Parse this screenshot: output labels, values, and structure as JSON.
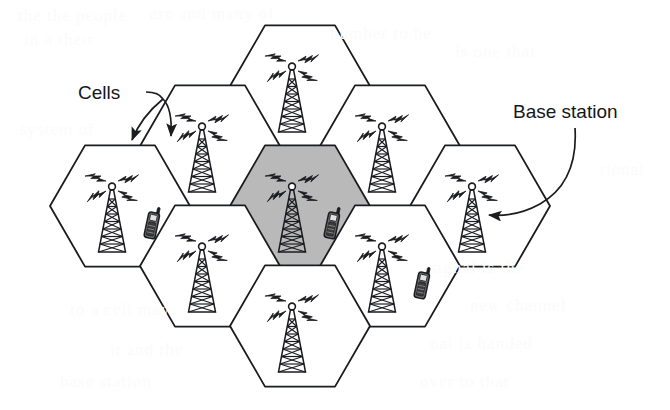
{
  "figure": {
    "background_color": "#ffffff",
    "stroke_color": "#1b1c20",
    "shaded_cell_color": "#b9b9b9",
    "labels": {
      "cells": "Cells",
      "base_station": "Base station"
    },
    "annotations": [
      {
        "id": "cells-label",
        "text": "Cells",
        "x": 110,
        "y": 93,
        "arrows": 2
      },
      {
        "id": "base-station-label",
        "text": "Base station",
        "x": 588,
        "y": 112,
        "arrows": 1
      }
    ],
    "cells": [
      {
        "id": "cell-top",
        "cx": 300,
        "cy": 86,
        "shaded": false,
        "tower": true,
        "phone": false
      },
      {
        "id": "cell-upper-left",
        "cx": 210,
        "cy": 146,
        "shaded": false,
        "tower": true,
        "phone": false
      },
      {
        "id": "cell-upper-right",
        "cx": 390,
        "cy": 146,
        "shaded": false,
        "tower": true,
        "phone": false
      },
      {
        "id": "cell-left",
        "cx": 120,
        "cy": 206,
        "shaded": false,
        "tower": true,
        "phone": true
      },
      {
        "id": "cell-center",
        "cx": 300,
        "cy": 206,
        "shaded": true,
        "tower": true,
        "phone": true
      },
      {
        "id": "cell-right",
        "cx": 480,
        "cy": 206,
        "shaded": false,
        "tower": true,
        "phone": false
      },
      {
        "id": "cell-lower-left",
        "cx": 210,
        "cy": 266,
        "shaded": false,
        "tower": true,
        "phone": false
      },
      {
        "id": "cell-lower-right",
        "cx": 390,
        "cy": 266,
        "shaded": false,
        "tower": true,
        "phone": true
      },
      {
        "id": "cell-bottom",
        "cx": 300,
        "cy": 326,
        "shaded": false,
        "tower": true,
        "phone": false
      }
    ],
    "cell_count": 9,
    "tower_count": 9,
    "phone_count": 3,
    "shaded_cell_count": 1,
    "hex_radius": 70,
    "legend_note": "Each hexagon represents one cell served by a base station tower; mobile handsets roam between cells."
  },
  "bleed_text": [
    {
      "text": "the the people",
      "x": 18,
      "y": 6,
      "size": 17
    },
    {
      "text": "are and many of",
      "x": 150,
      "y": 4,
      "size": 17
    },
    {
      "text": "in a their",
      "x": 24,
      "y": 30,
      "size": 17
    },
    {
      "text": "number to be",
      "x": 330,
      "y": 24,
      "size": 17
    },
    {
      "text": "is one that",
      "x": 455,
      "y": 42,
      "size": 17
    },
    {
      "text": "system of",
      "x": 20,
      "y": 120,
      "size": 17
    },
    {
      "text": "tional",
      "x": 600,
      "y": 160,
      "size": 17
    },
    {
      "text": "signal is the",
      "x": 430,
      "y": 258,
      "size": 17
    },
    {
      "text": "to a cell may",
      "x": 70,
      "y": 300,
      "size": 17
    },
    {
      "text": "new channel",
      "x": 470,
      "y": 296,
      "size": 17
    },
    {
      "text": "it and the",
      "x": 110,
      "y": 340,
      "size": 17
    },
    {
      "text": "nal is handed",
      "x": 430,
      "y": 334,
      "size": 17
    },
    {
      "text": "base station",
      "x": 60,
      "y": 372,
      "size": 17
    },
    {
      "text": "over to that",
      "x": 420,
      "y": 372,
      "size": 17
    }
  ]
}
